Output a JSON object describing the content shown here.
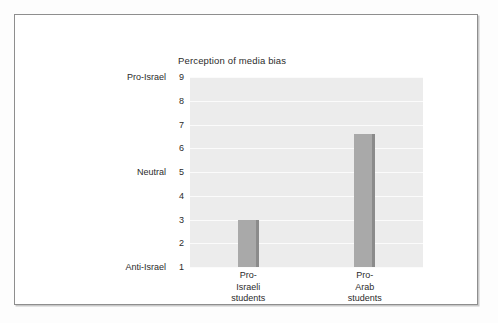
{
  "figure": {
    "title": "Perception of media bias"
  },
  "chart_data": {
    "type": "bar",
    "title": "Perception of media bias",
    "xlabel": "",
    "ylabel": "",
    "ylim": [
      1,
      9
    ],
    "grid": true,
    "legend": null,
    "categories": [
      "Pro-Israeli students",
      "Pro-Arab students"
    ],
    "category_lines": [
      [
        "Pro-",
        "Israeli",
        "students"
      ],
      [
        "Pro-",
        "Arab",
        "students"
      ]
    ],
    "values": [
      3.0,
      6.6
    ],
    "y_ticks": [
      1,
      2,
      3,
      4,
      5,
      6,
      7,
      8,
      9
    ],
    "y_tick_labels": [
      "1",
      "2",
      "3",
      "4",
      "5",
      "6",
      "7",
      "8",
      "9"
    ],
    "y_category_labels": [
      {
        "value": 9,
        "label": "Pro-Israel"
      },
      {
        "value": 5,
        "label": "Neutral"
      },
      {
        "value": 1,
        "label": "Anti-Israel"
      }
    ],
    "colors": {
      "bar_fill": "#a9a9a9",
      "bar_edge": "#8b8b8b",
      "plot_background": "#ececec",
      "gridline": "#fbfbfb",
      "text": "#2b2b2b",
      "frame_border": "#8e8e8e"
    }
  }
}
